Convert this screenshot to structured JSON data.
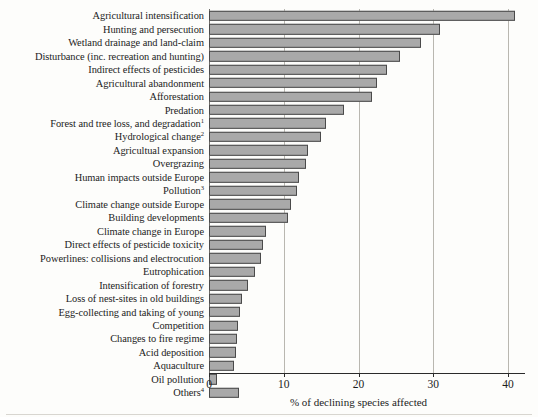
{
  "chart_data": {
    "type": "bar",
    "orientation": "horizontal",
    "title": "",
    "xlabel": "% of declining species affected",
    "ylabel": "",
    "xlim": [
      0,
      40
    ],
    "xticks": [
      0,
      10,
      20,
      30,
      40
    ],
    "xtick_labels": [
      "0",
      "10",
      "20",
      "30",
      "40"
    ],
    "grid": "vertical",
    "legend": "none",
    "bar_color": "#a9a9a9",
    "bar_edge_color": "#4a4a4a",
    "categories": [
      "Agricultural intensification",
      "Hunting and persecution",
      "Wetland drainage and land-claim",
      "Disturbance (inc. recreation and hunting)",
      "Indirect effects of pesticides",
      "Agricultural abandonment",
      "Afforestation",
      "Predation",
      "Forest and tree loss, and degradation",
      "Hydrological change",
      "Agricultual expansion",
      "Overgrazing",
      "Human impacts outside Europe",
      "Pollution",
      "Climate change outside Europe",
      "Building developments",
      "Climate change in Europe",
      "Direct effects of pesticide toxicity",
      "Powerlines: collisions and electrocution",
      "Eutrophication",
      "Intensification of forestry",
      "Loss of nest-sites in old buildings",
      "Egg-collecting and taking of young",
      "Competition",
      "Changes to fire regime",
      "Acid deposition",
      "Aquaculture",
      "Oil pollution",
      "Others"
    ],
    "category_footnotes": [
      "",
      "",
      "",
      "",
      "",
      "",
      "",
      "",
      "1",
      "2",
      "",
      "",
      "",
      "3",
      "",
      "",
      "",
      "",
      "",
      "",
      "",
      "",
      "",
      "",
      "",
      "",
      "",
      "",
      "4"
    ],
    "values": [
      41.0,
      30.9,
      28.3,
      25.5,
      23.8,
      22.5,
      21.8,
      18.0,
      15.6,
      15.0,
      13.3,
      13.0,
      12.0,
      11.8,
      11.0,
      10.6,
      7.6,
      7.2,
      7.0,
      6.2,
      5.2,
      4.4,
      4.2,
      3.9,
      3.8,
      3.6,
      3.4,
      1.1,
      4.0
    ]
  },
  "axis": {
    "x_title": "% of declining species affected"
  }
}
